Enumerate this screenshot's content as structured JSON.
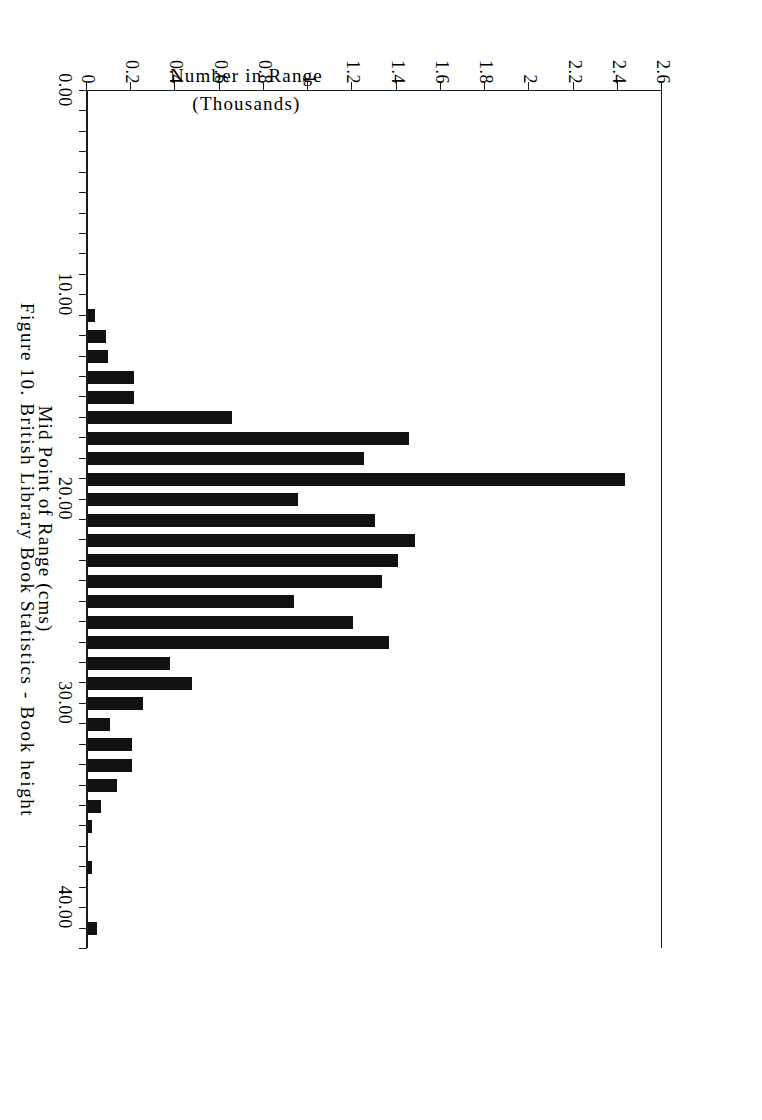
{
  "caption": "Figure 10. British Library Book Statistics - Book height",
  "axes": {
    "x_title": "Mid Point of Range (cms)",
    "y_title_line1": "Number in Range",
    "y_title_line2": "(Thousands)",
    "x_tick_labels": [
      "0.00",
      "10.00",
      "20.00",
      "30.00",
      "40.00"
    ],
    "x_tick_values": [
      0,
      10,
      20,
      30,
      40
    ],
    "y_tick_labels": [
      "0",
      "0.2",
      "0.4",
      "0.6",
      "0.8",
      "1",
      "1.2",
      "1.4",
      "1.6",
      "1.8",
      "2",
      "2.2",
      "2.4",
      "2.6"
    ],
    "y_tick_values": [
      0,
      0.2,
      0.4,
      0.6,
      0.8,
      1,
      1.2,
      1.4,
      1.6,
      1.8,
      2,
      2.2,
      2.4,
      2.6
    ]
  },
  "style": {
    "bar_color": "#111111",
    "axis_color": "#1a1a1a",
    "background": "#ffffff"
  },
  "chart_data": {
    "type": "bar",
    "title": "Figure 10. British Library Book Statistics - Book height",
    "xlabel": "Mid Point of Range (cms)",
    "ylabel": "Number in Range (Thousands)",
    "xlim": [
      0,
      42
    ],
    "ylim": [
      0,
      2.6
    ],
    "grid": false,
    "legend": "none",
    "orientation": "horizontal-printed-sideways",
    "categories": [
      11,
      12,
      13,
      14,
      15,
      16,
      17,
      18,
      19,
      20,
      21,
      22,
      23,
      24,
      25,
      26,
      27,
      28,
      29,
      30,
      31,
      32,
      33,
      34,
      35,
      36,
      38,
      41
    ],
    "values": [
      0.03,
      0.08,
      0.09,
      0.21,
      0.21,
      0.65,
      1.45,
      1.25,
      2.43,
      0.95,
      1.3,
      1.48,
      1.4,
      1.33,
      0.93,
      1.2,
      1.36,
      0.37,
      0.47,
      0.25,
      0.1,
      0.2,
      0.2,
      0.13,
      0.06,
      0.02,
      0.02,
      0.04
    ]
  }
}
